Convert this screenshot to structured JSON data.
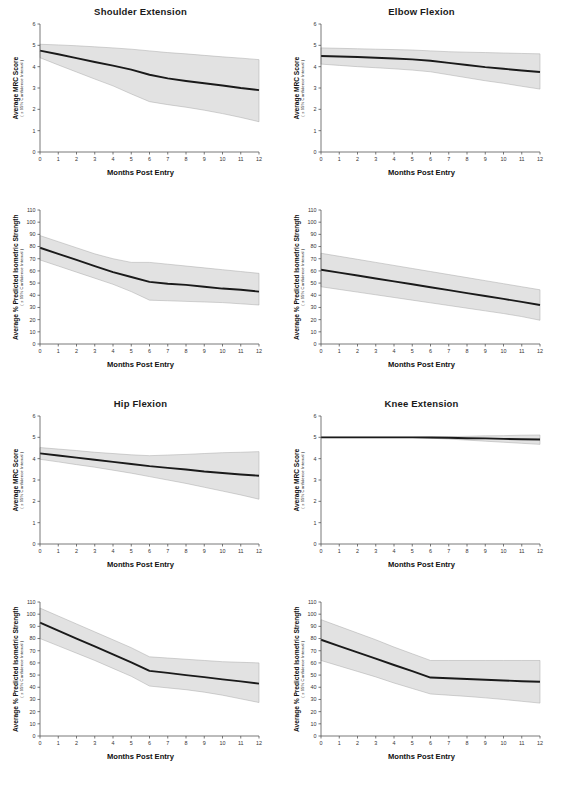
{
  "figure": {
    "background": "#ffffff",
    "line_color": "#1a1a1a",
    "band_fill": "#e2e2e2",
    "band_stroke": "#a8a8a8",
    "axis_color": "#555555",
    "xlabel": "Months Post Entry",
    "ci_note": "( ± 95% Confidence Interval )",
    "ylabel_mrc": "Average MRC Score",
    "ylabel_strength": "Average % Predicted Isometric Strength"
  },
  "chart_data": [
    {
      "type": "line",
      "title": "Shoulder Extension",
      "measure": "mrc",
      "xlabel": "Months Post Entry",
      "ylabel": "Average MRC Score",
      "annotation": "( ± 95% Confidence Interval )",
      "xlim": [
        0,
        12
      ],
      "ylim": [
        0,
        6
      ],
      "xticks": [
        0,
        1,
        2,
        3,
        4,
        5,
        6,
        7,
        8,
        9,
        10,
        11,
        12
      ],
      "yticks": [
        0,
        1,
        2,
        3,
        4,
        5,
        6
      ],
      "grid": false,
      "legend": "none",
      "x": [
        0,
        1,
        2,
        3,
        4,
        5,
        6,
        7,
        8,
        9,
        10,
        11,
        12
      ],
      "series": [
        {
          "name": "mean",
          "values": [
            4.75,
            4.58,
            4.4,
            4.22,
            4.05,
            3.86,
            3.62,
            3.45,
            3.33,
            3.22,
            3.12,
            3.0,
            2.9
          ]
        },
        {
          "name": "upper_95",
          "values": [
            5.05,
            5.02,
            4.98,
            4.93,
            4.88,
            4.82,
            4.74,
            4.66,
            4.6,
            4.53,
            4.46,
            4.4,
            4.33
          ]
        },
        {
          "name": "lower_95",
          "values": [
            4.42,
            4.08,
            3.75,
            3.42,
            3.1,
            2.72,
            2.36,
            2.22,
            2.1,
            1.96,
            1.8,
            1.62,
            1.42
          ]
        }
      ]
    },
    {
      "type": "line",
      "title": "Elbow Flexion",
      "measure": "mrc",
      "xlabel": "Months Post Entry",
      "ylabel": "Average MRC Score",
      "annotation": "( ± 95% Confidence Interval )",
      "xlim": [
        0,
        12
      ],
      "ylim": [
        0,
        6
      ],
      "xticks": [
        0,
        1,
        2,
        3,
        4,
        5,
        6,
        7,
        8,
        9,
        10,
        11,
        12
      ],
      "yticks": [
        0,
        1,
        2,
        3,
        4,
        5,
        6
      ],
      "grid": false,
      "legend": "none",
      "x": [
        0,
        1,
        2,
        3,
        4,
        5,
        6,
        7,
        8,
        9,
        10,
        11,
        12
      ],
      "series": [
        {
          "name": "mean",
          "values": [
            4.5,
            4.48,
            4.45,
            4.42,
            4.38,
            4.34,
            4.28,
            4.18,
            4.08,
            3.98,
            3.9,
            3.82,
            3.75
          ]
        },
        {
          "name": "upper_95",
          "values": [
            4.88,
            4.86,
            4.84,
            4.82,
            4.8,
            4.78,
            4.74,
            4.7,
            4.68,
            4.66,
            4.64,
            4.62,
            4.6
          ]
        },
        {
          "name": "lower_95",
          "values": [
            4.12,
            4.06,
            4.0,
            3.95,
            3.9,
            3.84,
            3.76,
            3.62,
            3.48,
            3.34,
            3.22,
            3.08,
            2.95
          ]
        }
      ]
    },
    {
      "type": "line",
      "title": "Shoulder Extension",
      "measure": "strength",
      "xlabel": "Months Post Entry",
      "ylabel": "Average % Predicted Isometric Strength",
      "annotation": "( ± 95% Confidence Interval )",
      "xlim": [
        0,
        12
      ],
      "ylim": [
        0,
        110
      ],
      "xticks": [
        0,
        1,
        2,
        3,
        4,
        5,
        6,
        7,
        8,
        9,
        10,
        11,
        12
      ],
      "yticks": [
        0,
        10,
        20,
        30,
        40,
        50,
        60,
        70,
        80,
        90,
        100,
        110
      ],
      "grid": false,
      "legend": "none",
      "x": [
        0,
        1,
        2,
        3,
        4,
        5,
        6,
        7,
        8,
        9,
        10,
        11,
        12
      ],
      "series": [
        {
          "name": "mean",
          "values": [
            79,
            74,
            69,
            64,
            59,
            55,
            51,
            49.5,
            48.5,
            47,
            45.5,
            44.5,
            43
          ]
        },
        {
          "name": "upper_95",
          "values": [
            89,
            84,
            79,
            74,
            70,
            67,
            67,
            65.5,
            64,
            62.5,
            61,
            59.5,
            58
          ]
        },
        {
          "name": "lower_95",
          "values": [
            69,
            64,
            59,
            54,
            49,
            43,
            36,
            35.5,
            35,
            34.5,
            34,
            33,
            32
          ]
        }
      ]
    },
    {
      "type": "line",
      "title": "Elbow Flexion",
      "measure": "strength",
      "xlabel": "Months Post Entry",
      "ylabel": "Average % Predicted Isometric Strength",
      "annotation": "( ± 95% Confidence Interval )",
      "xlim": [
        0,
        12
      ],
      "ylim": [
        0,
        110
      ],
      "xticks": [
        0,
        1,
        2,
        3,
        4,
        5,
        6,
        7,
        8,
        9,
        10,
        11,
        12
      ],
      "yticks": [
        0,
        10,
        20,
        30,
        40,
        50,
        60,
        70,
        80,
        90,
        100,
        110
      ],
      "grid": false,
      "legend": "none",
      "x": [
        0,
        1,
        2,
        3,
        4,
        5,
        6,
        7,
        8,
        9,
        10,
        11,
        12
      ],
      "series": [
        {
          "name": "mean",
          "values": [
            61,
            58.6,
            56.2,
            53.8,
            51.4,
            49,
            46.6,
            44.2,
            41.8,
            39.4,
            37,
            34.6,
            32
          ]
        },
        {
          "name": "upper_95",
          "values": [
            74.5,
            72,
            69.5,
            67,
            64.5,
            62,
            59.5,
            57,
            54.5,
            52,
            49.5,
            47,
            44.5
          ]
        },
        {
          "name": "lower_95",
          "values": [
            47,
            44.8,
            42.6,
            40.4,
            38.2,
            36,
            33.8,
            31.6,
            29.4,
            27.2,
            25,
            22.5,
            19.5
          ]
        }
      ]
    },
    {
      "type": "line",
      "title": "Hip Flexion",
      "measure": "mrc",
      "xlabel": "Months Post Entry",
      "ylabel": "Average MRC Score",
      "annotation": "( ± 95% Confidence Interval )",
      "xlim": [
        0,
        12
      ],
      "ylim": [
        0,
        6
      ],
      "xticks": [
        0,
        1,
        2,
        3,
        4,
        5,
        6,
        7,
        8,
        9,
        10,
        11,
        12
      ],
      "yticks": [
        0,
        1,
        2,
        3,
        4,
        5,
        6
      ],
      "grid": false,
      "legend": "none",
      "x": [
        0,
        1,
        2,
        3,
        4,
        5,
        6,
        7,
        8,
        9,
        10,
        11,
        12
      ],
      "series": [
        {
          "name": "mean",
          "values": [
            4.25,
            4.15,
            4.05,
            3.95,
            3.85,
            3.75,
            3.65,
            3.57,
            3.49,
            3.4,
            3.33,
            3.26,
            3.2
          ]
        },
        {
          "name": "upper_95",
          "values": [
            4.52,
            4.45,
            4.38,
            4.3,
            4.24,
            4.18,
            4.14,
            4.17,
            4.2,
            4.24,
            4.28,
            4.3,
            4.33
          ]
        },
        {
          "name": "lower_95",
          "values": [
            3.97,
            3.85,
            3.72,
            3.6,
            3.46,
            3.32,
            3.16,
            3.0,
            2.84,
            2.66,
            2.48,
            2.3,
            2.1
          ]
        }
      ]
    },
    {
      "type": "line",
      "title": "Knee Extension",
      "measure": "mrc",
      "xlabel": "Months Post Entry",
      "ylabel": "Average MRC Score",
      "annotation": "( ± 95% Confidence Interval )",
      "xlim": [
        0,
        12
      ],
      "ylim": [
        0,
        6
      ],
      "xticks": [
        0,
        1,
        2,
        3,
        4,
        5,
        6,
        7,
        8,
        9,
        10,
        11,
        12
      ],
      "yticks": [
        0,
        1,
        2,
        3,
        4,
        5,
        6
      ],
      "grid": false,
      "legend": "none",
      "x": [
        0,
        1,
        2,
        3,
        4,
        5,
        6,
        7,
        8,
        9,
        10,
        11,
        12
      ],
      "series": [
        {
          "name": "mean",
          "values": [
            5.0,
            5.0,
            5.0,
            5.0,
            5.0,
            5.0,
            4.99,
            4.98,
            4.96,
            4.95,
            4.93,
            4.91,
            4.9
          ]
        },
        {
          "name": "upper_95",
          "values": [
            5.01,
            5.01,
            5.01,
            5.01,
            5.01,
            5.01,
            5.02,
            5.03,
            5.05,
            5.07,
            5.08,
            5.1,
            5.11
          ]
        },
        {
          "name": "lower_95",
          "values": [
            4.99,
            4.99,
            4.99,
            4.99,
            4.99,
            4.99,
            4.96,
            4.92,
            4.87,
            4.82,
            4.77,
            4.72,
            4.67
          ]
        }
      ]
    },
    {
      "type": "line",
      "title": "Hip Flexion",
      "measure": "strength",
      "xlabel": "Months Post Entry",
      "ylabel": "Average % Predicted Isometric Strength",
      "annotation": "( ± 95% Confidence Interval )",
      "xlim": [
        0,
        110
      ],
      "ylim": [
        0,
        110
      ],
      "xticks": [
        0,
        1,
        2,
        3,
        4,
        5,
        6,
        7,
        8,
        9,
        10,
        11,
        12
      ],
      "yticks": [
        0,
        10,
        20,
        30,
        40,
        50,
        60,
        70,
        80,
        90,
        100,
        110
      ],
      "grid": false,
      "legend": "none",
      "x": [
        0,
        1,
        2,
        3,
        4,
        5,
        6,
        7,
        8,
        9,
        10,
        11,
        12
      ],
      "series": [
        {
          "name": "mean",
          "values": [
            93,
            86.5,
            80,
            73.5,
            67,
            60.5,
            53.5,
            51.8,
            50,
            48.3,
            46.5,
            44.8,
            43
          ]
        },
        {
          "name": "upper_95",
          "values": [
            105,
            98.5,
            92,
            85.5,
            79,
            72.5,
            65,
            64,
            63,
            62,
            61,
            60.5,
            60
          ]
        },
        {
          "name": "lower_95",
          "values": [
            80,
            74,
            68,
            62,
            55.5,
            49,
            41,
            39.5,
            38,
            36,
            33.5,
            30.5,
            27.5
          ]
        }
      ]
    },
    {
      "type": "line",
      "title": "Knee Extension",
      "measure": "strength",
      "xlabel": "Months Post Entry",
      "ylabel": "Average % Predicted Isometric Strength",
      "annotation": "( ± 95% Confidence Interval )",
      "xlim": [
        0,
        12
      ],
      "ylim": [
        0,
        110
      ],
      "xticks": [
        0,
        1,
        2,
        3,
        4,
        5,
        6,
        7,
        8,
        9,
        10,
        11,
        12
      ],
      "yticks": [
        0,
        10,
        20,
        30,
        40,
        50,
        60,
        70,
        80,
        90,
        100,
        110
      ],
      "grid": false,
      "legend": "none",
      "x": [
        0,
        1,
        2,
        3,
        4,
        5,
        6,
        7,
        8,
        9,
        10,
        11,
        12
      ],
      "series": [
        {
          "name": "mean",
          "values": [
            79,
            73.8,
            68.7,
            63.5,
            58.3,
            53.2,
            48,
            47.4,
            46.8,
            46.2,
            45.6,
            45,
            44.5
          ]
        },
        {
          "name": "upper_95",
          "values": [
            95.5,
            90,
            84.5,
            79,
            73,
            67.5,
            62,
            62,
            62,
            62,
            62,
            62,
            62
          ]
        },
        {
          "name": "lower_95",
          "values": [
            62,
            57.5,
            53,
            48.5,
            43.5,
            39,
            34.5,
            33.5,
            32.5,
            31.3,
            30,
            28.5,
            27
          ]
        }
      ]
    }
  ]
}
